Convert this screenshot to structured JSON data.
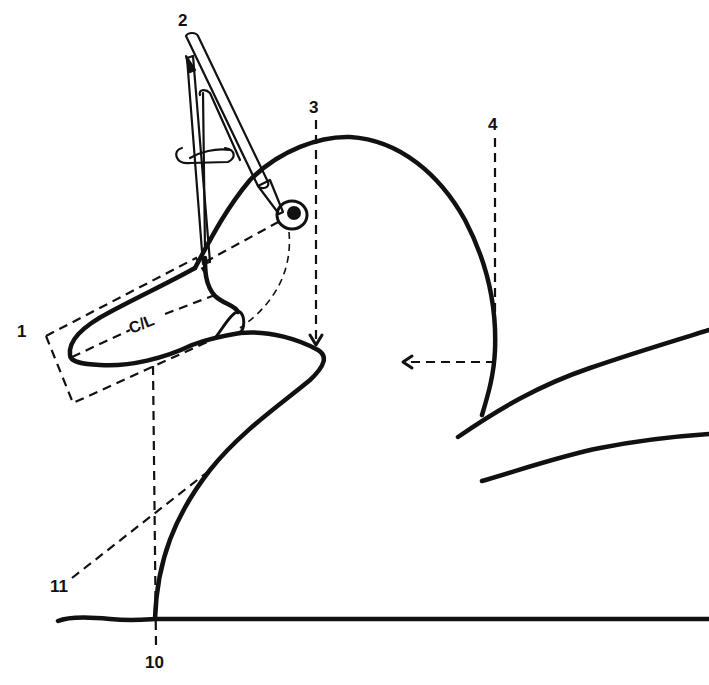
{
  "diagram": {
    "callouts": [
      {
        "id": "1",
        "label": "1",
        "describes": "bill bounding box"
      },
      {
        "id": "2",
        "label": "2",
        "describes": "dividers / compass measuring bill to eye"
      },
      {
        "id": "3",
        "label": "3",
        "describes": "vertical reference to back of head / neck"
      },
      {
        "id": "4",
        "label": "4",
        "describes": "vertical reference at back of head"
      },
      {
        "id": "10",
        "label": "10",
        "describes": "vertical reference line at breast base"
      },
      {
        "id": "11",
        "label": "11",
        "describes": "angled breast reference line"
      }
    ],
    "bill_centerline_label": "C/L",
    "colors": {
      "ink": "#111111",
      "paper": "#ffffff"
    }
  }
}
